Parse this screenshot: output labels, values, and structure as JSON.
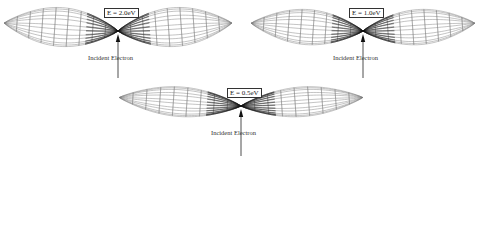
{
  "figure": {
    "panels": [
      {
        "id": "e2",
        "energy_label": "E = 2.0eV",
        "incident_label": "Incident Electron",
        "center": [
          118,
          31
        ],
        "lobe_length": 114,
        "lobe_half_height": 21,
        "tilt_deg": -4,
        "label_pos": [
          104,
          8
        ],
        "arrow_bottom": 78
      },
      {
        "id": "e1",
        "energy_label": "E = 1.0eV",
        "incident_label": "Incident Electron",
        "center": [
          363,
          31
        ],
        "lobe_length": 112,
        "lobe_half_height": 19,
        "tilt_deg": -4,
        "label_pos": [
          349,
          8
        ],
        "arrow_bottom": 78
      },
      {
        "id": "e05",
        "energy_label": "E = 0.5eV",
        "incident_label": "Incident Electron",
        "center": [
          241,
          106
        ],
        "lobe_length": 122,
        "lobe_half_height": 16,
        "tilt_deg": -4,
        "label_pos": [
          227,
          88
        ],
        "arrow_bottom": 156
      }
    ],
    "colors": {
      "wire": "#7a7a7a",
      "dense": "#111111",
      "text": "#222222"
    },
    "wireframe": {
      "meridians": 12,
      "rings": 9
    }
  }
}
